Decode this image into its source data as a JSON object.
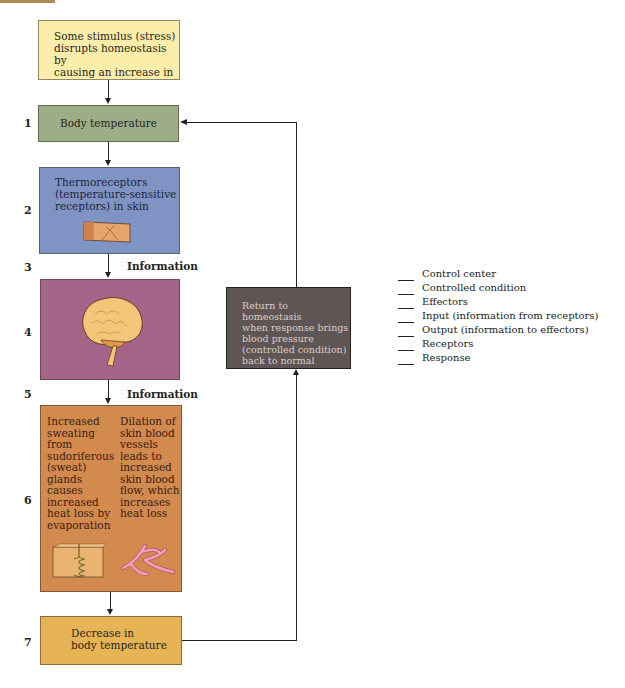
{
  "diagram": {
    "stimulus_box": {
      "text": "Some stimulus (stress) disrupts homeostasis by causing an increase in",
      "lines": [
        "Some stimulus (stress)",
        "disrupts homeostasis by",
        "causing an increase in"
      ],
      "color": "#fbeeaa"
    },
    "steps": [
      {
        "number": "1",
        "label": "Body temperature",
        "color": "#9cae86"
      },
      {
        "number": "2",
        "lines": [
          "Thermoreceptors",
          "(temperature-sensitive",
          "receptors) in skin"
        ],
        "icon": "skin-block-icon",
        "color": "#7f94c4"
      },
      {
        "number": "3",
        "arrow_label": "Information"
      },
      {
        "number": "4",
        "icon": "brain-icon",
        "color": "#a5648a"
      },
      {
        "number": "5",
        "arrow_label": "Information"
      },
      {
        "number": "6",
        "color": "#d38a4e",
        "left_column": [
          "Increased",
          "sweating",
          "from",
          "sudoriferous",
          "(sweat)",
          "glands",
          "causes",
          "increased",
          "heat loss by",
          "evaporation"
        ],
        "right_column": [
          "Dilation of",
          "skin blood",
          "vessels",
          "leads to",
          "increased",
          "skin blood",
          "flow, which",
          "increases",
          "heat loss"
        ],
        "left_icon": "sweat-gland-icon",
        "right_icon": "blood-vessel-icon"
      },
      {
        "number": "7",
        "lines": [
          "Decrease in",
          "body temperature"
        ],
        "color": "#e6b455"
      }
    ],
    "return_box": {
      "lines": [
        "Return to homeostasis",
        "when response brings",
        "blood pressure",
        "(controlled condition)",
        "back to normal"
      ],
      "color": "#5f5555"
    },
    "legend": {
      "blank": "___",
      "items": [
        "Control center",
        "Controlled condition",
        "Effectors",
        "Input (information from receptors)",
        "Output (information to effectors)",
        "Receptors",
        "Response"
      ]
    }
  }
}
